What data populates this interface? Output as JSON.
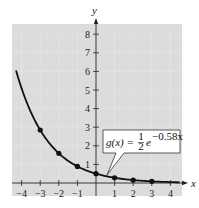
{
  "chart_data": {
    "type": "line",
    "title": "",
    "xlabel": "x",
    "ylabel": "y",
    "xlim": [
      -4.3,
      4.6
    ],
    "ylim": [
      -0.6,
      8.6
    ],
    "grid": true,
    "background": "#d9d9d9",
    "x_ticks": [
      -4,
      -3,
      -2,
      -1,
      1,
      2,
      3,
      4
    ],
    "x_tick_labels": [
      "−4",
      "−3",
      "−2",
      "−1",
      "1",
      "2",
      "3",
      "4"
    ],
    "y_ticks": [
      1,
      2,
      3,
      4,
      5,
      6,
      7,
      8
    ],
    "y_tick_labels": [
      "1",
      "2",
      "3",
      "4",
      "5",
      "6",
      "7",
      "8"
    ],
    "function": "g(x) = 1/2 e^(-0.58x)",
    "series": [
      {
        "name": "g(x) = ½e^(−0.58x)",
        "curve_x_range": [
          -4.3,
          4.5
        ],
        "points": [
          {
            "x": -3,
            "y": 2.85
          },
          {
            "x": -2,
            "y": 1.59
          },
          {
            "x": -1,
            "y": 0.89
          },
          {
            "x": 0,
            "y": 0.5
          },
          {
            "x": 1,
            "y": 0.28
          },
          {
            "x": 2,
            "y": 0.16
          },
          {
            "x": 3,
            "y": 0.09
          }
        ]
      }
    ],
    "annotation": {
      "text_prefix": "g(x) = ",
      "fraction_num": "1",
      "fraction_den": "2",
      "base": "e",
      "exponent": "−0.58x",
      "pointer_to": {
        "x": 0.6,
        "y": 0.35
      }
    }
  }
}
